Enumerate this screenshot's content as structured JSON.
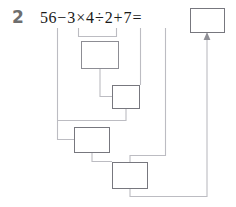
{
  "problem": {
    "number": "2",
    "expression_text": "56−3×4÷2+7=",
    "tokens": [
      {
        "t": "56"
      },
      {
        "t": "−"
      },
      {
        "t": "3"
      },
      {
        "t": "×"
      },
      {
        "t": "4"
      },
      {
        "t": "÷"
      },
      {
        "t": "2"
      },
      {
        "t": "+"
      },
      {
        "t": "7"
      },
      {
        "t": "="
      }
    ]
  },
  "answer_boxes": [
    {
      "id": "result-box",
      "value": "",
      "label": "final-answer-box"
    },
    {
      "id": "step-1-box",
      "value": "",
      "label": "step-1-box"
    },
    {
      "id": "step-2-box",
      "value": "",
      "label": "step-2-box"
    },
    {
      "id": "step-3-box",
      "value": "",
      "label": "step-3-box"
    },
    {
      "id": "step-4-box",
      "value": "",
      "label": "step-4-box"
    }
  ],
  "colors": {
    "number": "#6e6e6e",
    "text": "#1a1a1a",
    "box_border": "#8d8d94",
    "connector": "#b9b9bf",
    "arrow": "#9a9aa0"
  },
  "diagram": {
    "connector_count": 9
  }
}
